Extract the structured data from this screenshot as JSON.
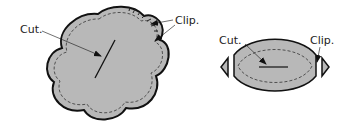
{
  "diagram": {
    "left_figure": {
      "shape": "five-lobed flower",
      "labels": {
        "cut": "Cut.",
        "clip": "Clip."
      }
    },
    "right_figure": {
      "shape": "lens / oval with clipped points",
      "labels": {
        "cut": "Cut.",
        "clip": "Clip."
      }
    },
    "colors": {
      "fill": "#b8b8b8",
      "outline": "#111111",
      "stitch": "#444444",
      "arrow": "#111111"
    }
  }
}
